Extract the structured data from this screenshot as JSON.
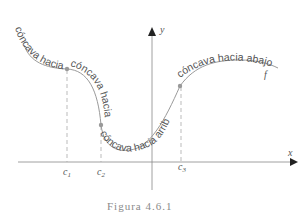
{
  "figure": {
    "caption": "Figura 4.6.1",
    "function_label": "f",
    "axes": {
      "x_label": "x",
      "y_label": "y"
    },
    "points": [
      {
        "label": "c",
        "sub": "1"
      },
      {
        "label": "c",
        "sub": "2"
      },
      {
        "label": "c",
        "sub": "3"
      }
    ],
    "regions": [
      {
        "text": "cóncava hacia arriba"
      },
      {
        "text": "cóncava hacia abajo"
      },
      {
        "text": "cóncava hacia arriba"
      },
      {
        "text": "cóncava hacia abajo"
      }
    ],
    "colors": {
      "curve": "#9a9a9a",
      "axis": "#777777",
      "point": "#999999",
      "dash": "#aaaaaa",
      "text": "#555555"
    }
  }
}
